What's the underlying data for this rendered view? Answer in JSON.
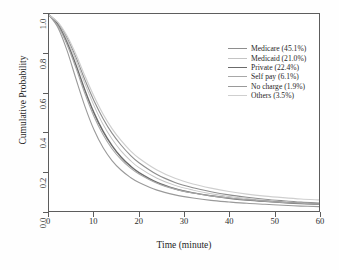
{
  "chart_data": {
    "type": "line",
    "title": "Health Insurance Status",
    "xlabel": "Time (minute)",
    "ylabel": "Cumulative Probability",
    "xlim": [
      0,
      60
    ],
    "ylim": [
      0.0,
      1.0
    ],
    "grid": false,
    "legend_position": "top-right",
    "xticks": [
      "0",
      "10",
      "20",
      "30",
      "40",
      "50",
      "60"
    ],
    "xtick_values": [
      0,
      10,
      20,
      30,
      40,
      50,
      60
    ],
    "yticks": [
      "0.0",
      "0.2",
      "0.4",
      "0.6",
      "0.8",
      "1.0"
    ],
    "ytick_values": [
      0.0,
      0.2,
      0.4,
      0.6,
      0.8,
      1.0
    ],
    "x": [
      0,
      2,
      4,
      6,
      8,
      10,
      12,
      14,
      16,
      18,
      20,
      24,
      28,
      32,
      36,
      40,
      44,
      48,
      52,
      56,
      60
    ],
    "series": [
      {
        "name": "Medicare (45.1%)",
        "label": "Medicare (45.1%)",
        "share_percent": 45.1,
        "color": "#8e8e8e",
        "width": 1.1,
        "values": [
          0.995,
          0.955,
          0.88,
          0.78,
          0.665,
          0.56,
          0.47,
          0.395,
          0.335,
          0.285,
          0.245,
          0.185,
          0.145,
          0.118,
          0.098,
          0.082,
          0.07,
          0.06,
          0.052,
          0.045,
          0.04
        ]
      },
      {
        "name": "Medicaid (21.0%)",
        "label": "Medicaid (21.0%)",
        "share_percent": 21.0,
        "color": "#c4c4c4",
        "width": 1.0,
        "values": [
          0.995,
          0.95,
          0.87,
          0.765,
          0.645,
          0.535,
          0.44,
          0.365,
          0.305,
          0.258,
          0.22,
          0.166,
          0.13,
          0.106,
          0.088,
          0.074,
          0.063,
          0.054,
          0.047,
          0.041,
          0.036
        ]
      },
      {
        "name": "Private (22.4%)",
        "label": "Private (22.4%)",
        "share_percent": 22.4,
        "color": "#6b6b6b",
        "width": 1.5,
        "values": [
          0.995,
          0.945,
          0.855,
          0.74,
          0.612,
          0.498,
          0.405,
          0.332,
          0.274,
          0.23,
          0.195,
          0.145,
          0.113,
          0.092,
          0.077,
          0.065,
          0.056,
          0.049,
          0.043,
          0.038,
          0.034
        ]
      },
      {
        "name": "Self pay (6.1%)",
        "label": "Self pay (6.1%)",
        "share_percent": 6.1,
        "color": "#a8a8a8",
        "width": 1.1,
        "values": [
          0.995,
          0.94,
          0.845,
          0.725,
          0.595,
          0.48,
          0.388,
          0.316,
          0.262,
          0.22,
          0.188,
          0.141,
          0.111,
          0.091,
          0.077,
          0.066,
          0.057,
          0.05,
          0.044,
          0.039,
          0.035
        ]
      },
      {
        "name": "No charge (1.9%)",
        "label": "No charge (1.9%)",
        "share_percent": 1.9,
        "color": "#9a9a9a",
        "width": 1.1,
        "values": [
          0.995,
          0.93,
          0.815,
          0.67,
          0.53,
          0.412,
          0.322,
          0.256,
          0.208,
          0.172,
          0.145,
          0.106,
          0.082,
          0.066,
          0.054,
          0.046,
          0.039,
          0.034,
          0.029,
          0.025,
          0.022
        ]
      },
      {
        "name": "Others (3.5%)",
        "label": "Others (3.5%)",
        "share_percent": 3.5,
        "color": "#cfcfcf",
        "width": 1.2,
        "values": [
          0.995,
          0.958,
          0.89,
          0.795,
          0.685,
          0.582,
          0.492,
          0.418,
          0.358,
          0.308,
          0.268,
          0.208,
          0.166,
          0.137,
          0.116,
          0.099,
          0.086,
          0.076,
          0.068,
          0.061,
          0.056
        ]
      }
    ]
  }
}
